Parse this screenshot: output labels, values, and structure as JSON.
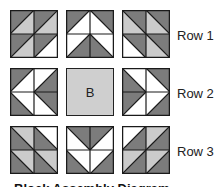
{
  "colors": {
    "dark": "#7c7c7c",
    "light": "#cbcbcb",
    "white": "#ffffff",
    "line": "#1a1a1a",
    "plain": "#cfcfcf"
  },
  "rows": [
    {
      "label": "Row 1"
    },
    {
      "label": "Row 2"
    },
    {
      "label": "Row 3"
    }
  ],
  "center_block_label": "B",
  "caption": "Block Assembly Diagram",
  "blocks": [
    [
      [
        [
          "/",
          "D",
          "L"
        ],
        [
          "/",
          "D",
          "L"
        ],
        [
          "/",
          "D",
          "L"
        ],
        [
          "/",
          "D",
          "W"
        ]
      ],
      [
        [
          "/",
          "D",
          "W"
        ],
        [
          "\\",
          "D",
          "W"
        ],
        [
          "/",
          "W",
          "D"
        ],
        [
          "\\",
          "W",
          "D"
        ]
      ],
      [
        [
          "\\",
          "D",
          "L"
        ],
        [
          "\\",
          "D",
          "L"
        ],
        [
          "\\",
          "D",
          "W"
        ],
        [
          "\\",
          "D",
          "L"
        ]
      ]
    ],
    [
      [
        [
          "/",
          "D",
          "W"
        ],
        [
          "/",
          "W",
          "D"
        ],
        [
          "\\",
          "W",
          "D"
        ],
        [
          "\\",
          "D",
          "W"
        ]
      ],
      null,
      [
        [
          "\\",
          "W",
          "D"
        ],
        [
          "\\",
          "D",
          "W"
        ],
        [
          "/",
          "D",
          "W"
        ],
        [
          "/",
          "W",
          "D"
        ]
      ]
    ],
    [
      [
        [
          "\\",
          "L",
          "D"
        ],
        [
          "\\",
          "W",
          "D"
        ],
        [
          "\\",
          "L",
          "D"
        ],
        [
          "\\",
          "L",
          "D"
        ]
      ],
      [
        [
          "\\",
          "D",
          "W"
        ],
        [
          "/",
          "D",
          "W"
        ],
        [
          "\\",
          "W",
          "D"
        ],
        [
          "/",
          "W",
          "D"
        ]
      ],
      [
        [
          "/",
          "W",
          "D"
        ],
        [
          "/",
          "L",
          "D"
        ],
        [
          "/",
          "L",
          "D"
        ],
        [
          "/",
          "L",
          "D"
        ]
      ]
    ]
  ]
}
